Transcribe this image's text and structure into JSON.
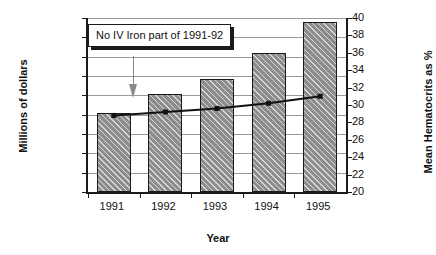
{
  "chart_data": {
    "type": "bar",
    "title": "",
    "xlabel": "Year",
    "ylabel": "Millions of dollars",
    "y2label": "Mean Hematocrits as %",
    "categories": [
      "1991",
      "1992",
      "1993",
      "1994",
      "1995"
    ],
    "ylim": [
      0,
      900
    ],
    "y2lim": [
      20,
      40
    ],
    "grid": true,
    "legend": "none",
    "ytick_labels": [
      "$900",
      "$800",
      "$700",
      "$600",
      "$500",
      "$400",
      "$300",
      "$200",
      "$100",
      "$-"
    ],
    "ytick_values": [
      900,
      800,
      700,
      600,
      500,
      400,
      300,
      200,
      100,
      0
    ],
    "y2tick_labels": [
      "40",
      "38",
      "36",
      "34",
      "32",
      "30",
      "28",
      "26",
      "24",
      "22",
      "20"
    ],
    "y2tick_values": [
      40,
      38,
      36,
      34,
      32,
      30,
      28,
      26,
      24,
      22,
      20
    ],
    "series": [
      {
        "name": "Millions of dollars",
        "type": "bar",
        "axis": "left",
        "values": [
          410,
          505,
          585,
          720,
          880
        ]
      },
      {
        "name": "Mean Hematocrits as %",
        "type": "line",
        "axis": "right",
        "values": [
          28.8,
          29.2,
          29.6,
          30.2,
          31.0
        ]
      }
    ],
    "annotations": [
      {
        "text": "No IV Iron part of 1991-92",
        "points_to": "1991"
      }
    ]
  }
}
